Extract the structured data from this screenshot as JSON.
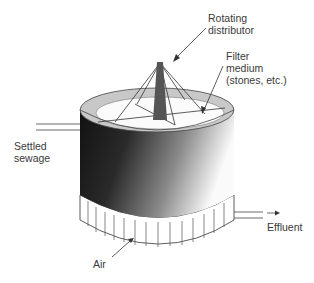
{
  "labels": {
    "distributor": "Rotating\ndistributor",
    "filter_medium": "Filter\nmedium\n(stones, etc.)",
    "settled_sewage": "Settled\nsewage",
    "effluent": "Effluent",
    "air": "Air"
  },
  "colors": {
    "outline": "#333333",
    "shaft": "#555555",
    "rim_gray": "#c8c8c8",
    "text": "#3a3a3a"
  }
}
